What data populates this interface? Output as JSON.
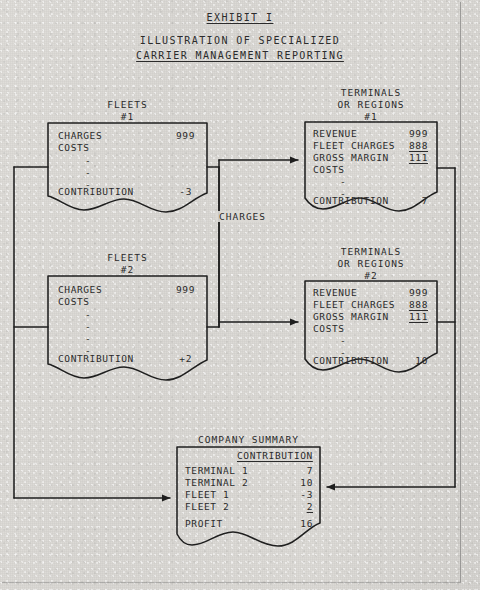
{
  "document": {
    "exhibit_label": "EXHIBIT I",
    "title_line1": "ILLUSTRATION OF SPECIALIZED",
    "title_line2": "CARRIER MANAGEMENT REPORTING"
  },
  "colors": {
    "ink": "#2b2b2b",
    "paper": "#dbd9d5",
    "line": "#1f1f1f"
  },
  "connector_labels": {
    "charges": "CHARGES"
  },
  "boxes": {
    "fleet1": {
      "caption_line1": "FLEETS",
      "caption_line2": "#1",
      "rows": [
        {
          "label": "CHARGES",
          "value": "999"
        },
        {
          "label": "COSTS",
          "value": ""
        }
      ],
      "dashes": 3,
      "total_label": "CONTRIBUTION",
      "total_value": "-3"
    },
    "fleet2": {
      "caption_line1": "FLEETS",
      "caption_line2": "#2",
      "rows": [
        {
          "label": "CHARGES",
          "value": "999"
        },
        {
          "label": "COSTS",
          "value": ""
        }
      ],
      "dashes": 4,
      "total_label": "CONTRIBUTION",
      "total_value": "+2"
    },
    "terminal1": {
      "caption_line1": "TERMINALS",
      "caption_line2": "OR REGIONS",
      "caption_line3": "#1",
      "rows": [
        {
          "label": "REVENUE",
          "value": "999",
          "rule": false
        },
        {
          "label": "FLEET CHARGES",
          "value": "888",
          "rule": true
        },
        {
          "label": "GROSS MARGIN",
          "value": "111",
          "rule": true
        },
        {
          "label": "COSTS",
          "value": "",
          "rule": false
        }
      ],
      "dashes": 2,
      "total_label": "CONTRIBUTION",
      "total_value": "7"
    },
    "terminal2": {
      "caption_line1": "TERMINALS",
      "caption_line2": "OR REGIONS",
      "caption_line3": "#2",
      "rows": [
        {
          "label": "REVENUE",
          "value": "999",
          "rule": false
        },
        {
          "label": "FLEET CHARGES",
          "value": "888",
          "rule": true
        },
        {
          "label": "GROSS MARGIN",
          "value": "111",
          "rule": true
        },
        {
          "label": "COSTS",
          "value": "",
          "rule": false
        }
      ],
      "dashes": 2,
      "total_label": "CONTRIBUTION",
      "total_value": "10"
    },
    "summary": {
      "caption": "COMPANY SUMMARY",
      "column_header": "CONTRIBUTION",
      "rows": [
        {
          "label": "TERMINAL 1",
          "value": "7",
          "rule": false
        },
        {
          "label": "TERMINAL 2",
          "value": "10",
          "rule": false
        },
        {
          "label": "FLEET 1",
          "value": "-3",
          "rule": false
        },
        {
          "label": "FLEET 2",
          "value": "2",
          "rule": true
        }
      ],
      "total_label": "PROFIT",
      "total_value": "16"
    }
  }
}
